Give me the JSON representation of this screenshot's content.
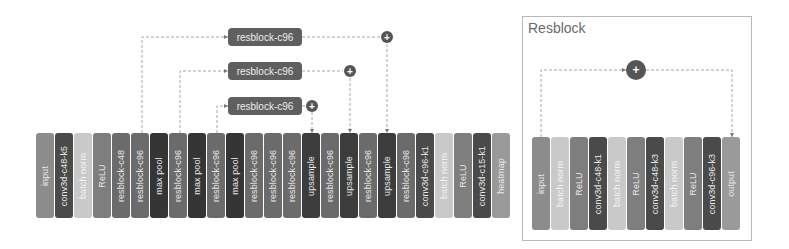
{
  "main_network": {
    "blocks": [
      {
        "label": "input",
        "color": "#8c8c8c"
      },
      {
        "label": "conv3d-c48-k5",
        "color": "#4a4a4a"
      },
      {
        "label": "batch norm",
        "color": "#c9c9c9"
      },
      {
        "label": "ReLU",
        "color": "#7e7e7e"
      },
      {
        "label": "resblock-c48",
        "color": "#6b6b6b"
      },
      {
        "label": "resblock-c96",
        "color": "#6b6b6b"
      },
      {
        "label": "max pool",
        "color": "#353535"
      },
      {
        "label": "resblock-c96",
        "color": "#6b6b6b"
      },
      {
        "label": "max pool",
        "color": "#353535"
      },
      {
        "label": "resblock-c96",
        "color": "#6b6b6b"
      },
      {
        "label": "max pool",
        "color": "#353535"
      },
      {
        "label": "resblock-c96",
        "color": "#6b6b6b"
      },
      {
        "label": "resblock-c96",
        "color": "#6b6b6b"
      },
      {
        "label": "resblock-c96",
        "color": "#6b6b6b"
      },
      {
        "label": "upsample",
        "color": "#3c3c3c"
      },
      {
        "label": "resblock-c96",
        "color": "#6b6b6b"
      },
      {
        "label": "upsample",
        "color": "#3c3c3c"
      },
      {
        "label": "resblock-c96",
        "color": "#6b6b6b"
      },
      {
        "label": "upsample",
        "color": "#3c3c3c"
      },
      {
        "label": "resblock-c96",
        "color": "#6b6b6b"
      },
      {
        "label": "conv3d-c96-k1",
        "color": "#4a4a4a"
      },
      {
        "label": "batch norm",
        "color": "#c9c9c9"
      },
      {
        "label": "ReLU",
        "color": "#7e7e7e"
      },
      {
        "label": "conv3d-c15-k1",
        "color": "#4a4a4a"
      },
      {
        "label": "heatmap",
        "color": "#9a9a9a"
      }
    ],
    "skip_resblocks": [
      {
        "label": "resblock-c96",
        "from_block": 5,
        "to_block": 18,
        "plus": "+"
      },
      {
        "label": "resblock-c96",
        "from_block": 7,
        "to_block": 16,
        "plus": "+"
      },
      {
        "label": "resblock-c96",
        "from_block": 9,
        "to_block": 14,
        "plus": "+"
      }
    ]
  },
  "resblock_panel": {
    "title": "Resblock",
    "plus": "+",
    "blocks": [
      {
        "label": "input",
        "color": "#8c8c8c"
      },
      {
        "label": "batch norm",
        "color": "#c9c9c9"
      },
      {
        "label": "ReLU",
        "color": "#7e7e7e"
      },
      {
        "label": "conv3d-c48-k1",
        "color": "#4a4a4a"
      },
      {
        "label": "batch norm",
        "color": "#c9c9c9"
      },
      {
        "label": "ReLU",
        "color": "#7e7e7e"
      },
      {
        "label": "conv3d-c48-k3",
        "color": "#4a4a4a"
      },
      {
        "label": "batch norm",
        "color": "#c9c9c9"
      },
      {
        "label": "ReLU",
        "color": "#7e7e7e"
      },
      {
        "label": "conv3d-c96-k3",
        "color": "#4a4a4a"
      },
      {
        "label": "output",
        "color": "#9a9a9a"
      }
    ]
  }
}
